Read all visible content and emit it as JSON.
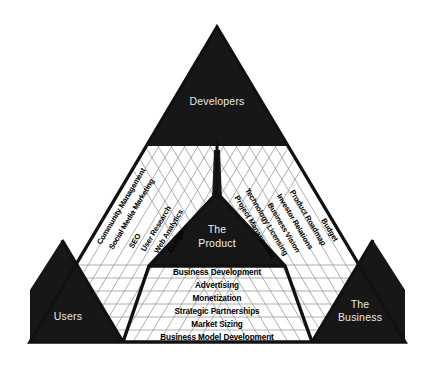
{
  "diagram": {
    "corners": {
      "top": "Developers",
      "bottom_left": "Users",
      "bottom_right_line1": "The",
      "bottom_right_line2": "Business"
    },
    "center_line1": "The",
    "center_line2": "Product",
    "left_side_labels": [
      "Community Management",
      "Social Media Marketing",
      "SEO",
      "User Research",
      "Web Analytics",
      "Design"
    ],
    "right_side_labels": [
      "Budget",
      "Product Roadmap",
      "Investor Relations",
      "Business Vision",
      "Technology Licensing",
      "Project Management"
    ],
    "bottom_rows": [
      "Business Development",
      "Advertising",
      "Monetization",
      "Strategic Partnerships",
      "Market Sizing",
      "Business Model Development"
    ],
    "colors": {
      "fill_black": "#171717",
      "background": "#ffffff",
      "grid_gray": "#8d8d8d",
      "label_white": "#e8e8e8"
    }
  }
}
